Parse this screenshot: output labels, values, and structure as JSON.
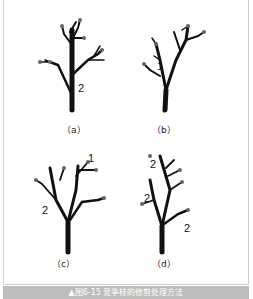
{
  "figure": {
    "caption": "▲图6-15  竞争枝的修剪处理方法",
    "panels": [
      {
        "label": "（a）",
        "markers": [
          "2"
        ]
      },
      {
        "label": "（b）",
        "markers": [
          "1"
        ]
      },
      {
        "label": "（c）",
        "markers": [
          "1",
          "2"
        ]
      },
      {
        "label": "（d）",
        "markers": [
          "2",
          "2",
          "2"
        ]
      }
    ]
  },
  "colors": {
    "border": "#cfcfcf",
    "caption_bg": "#bdbdbd",
    "caption_text": "#ffffff",
    "branch": "#111111"
  }
}
